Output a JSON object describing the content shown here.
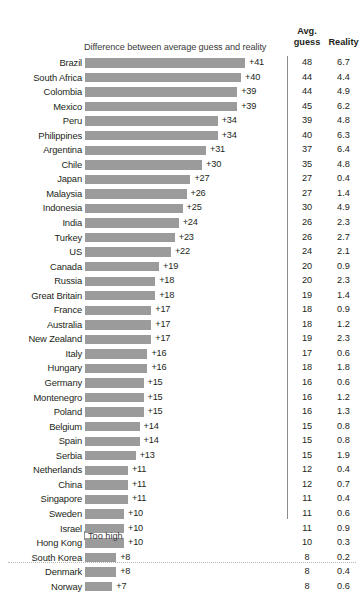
{
  "header": {
    "subtitle": "Difference between average guess and reality",
    "avg_line1": "Avg.",
    "avg_line2": "guess",
    "reality": "Reality"
  },
  "footer": {
    "too_high_label": "Too high"
  },
  "colors": {
    "bar": "#9b9b9b",
    "text": "#231f20",
    "divider": "#8c8c8c",
    "background": "#ffffff"
  },
  "chart_data": {
    "type": "bar",
    "title": "",
    "subtitle": "Difference between average guess and reality",
    "xlabel": "",
    "ylabel": "",
    "orientation": "horizontal",
    "grid": false,
    "legend": "none",
    "xlim": [
      0,
      41
    ],
    "annotations": [
      "Too high"
    ],
    "columns": [
      "Country",
      "Difference between average guess and reality",
      "Avg. guess",
      "Reality"
    ],
    "categories": [
      "Brazil",
      "South Africa",
      "Colombia",
      "Mexico",
      "Peru",
      "Philippines",
      "Argentina",
      "Chile",
      "Japan",
      "Malaysia",
      "Indonesia",
      "India",
      "Turkey",
      "US",
      "Canada",
      "Russia",
      "Great Britain",
      "France",
      "Australia",
      "New Zealand",
      "Italy",
      "Hungary",
      "Germany",
      "Montenegro",
      "Poland",
      "Belgium",
      "Spain",
      "Serbia",
      "Netherlands",
      "China",
      "Singapore",
      "Sweden",
      "Israel",
      "Hong Kong",
      "South Korea",
      "Denmark",
      "Norway"
    ],
    "values": [
      41,
      40,
      39,
      39,
      34,
      34,
      31,
      30,
      27,
      26,
      25,
      24,
      23,
      22,
      19,
      18,
      18,
      17,
      17,
      17,
      16,
      16,
      15,
      15,
      15,
      14,
      14,
      13,
      11,
      11,
      11,
      10,
      10,
      10,
      8,
      8,
      7
    ],
    "value_labels": [
      "+41",
      "+40",
      "+39",
      "+39",
      "+34",
      "+34",
      "+31",
      "+30",
      "+27",
      "+26",
      "+25",
      "+24",
      "+23",
      "+22",
      "+19",
      "+18",
      "+18",
      "+17",
      "+17",
      "+17",
      "+16",
      "+16",
      "+15",
      "+15",
      "+15",
      "+14",
      "+14",
      "+13",
      "+11",
      "+11",
      "+11",
      "+10",
      "+10",
      "+10",
      "+8",
      "+8",
      "+7"
    ],
    "series": [
      {
        "name": "Avg. guess",
        "values": [
          48,
          44,
          44,
          45,
          39,
          40,
          37,
          35,
          27,
          27,
          30,
          26,
          26,
          24,
          20,
          20,
          19,
          18,
          18,
          19,
          17,
          18,
          16,
          16,
          16,
          15,
          15,
          15,
          12,
          12,
          11,
          11,
          11,
          10,
          8,
          8,
          8
        ],
        "display": [
          "48",
          "44",
          "44",
          "45",
          "39",
          "40",
          "37",
          "35",
          "27",
          "27",
          "30",
          "26",
          "26",
          "24",
          "20",
          "20",
          "19",
          "18",
          "18",
          "19",
          "17",
          "18",
          "16",
          "16",
          "16",
          "15",
          "15",
          "15",
          "12",
          "12",
          "11",
          "11",
          "11",
          "10",
          "8",
          "8",
          "8"
        ]
      },
      {
        "name": "Reality",
        "values": [
          6.7,
          4.4,
          4.9,
          6.2,
          4.8,
          6.3,
          6.4,
          4.8,
          0.4,
          1.4,
          4.9,
          2.3,
          2.7,
          2.1,
          0.9,
          2.3,
          1.4,
          0.9,
          1.2,
          2.3,
          0.6,
          1.8,
          0.6,
          1.2,
          1.3,
          0.8,
          0.8,
          1.9,
          0.4,
          0.7,
          0.4,
          0.6,
          0.9,
          0.3,
          0.2,
          0.4,
          0.6
        ],
        "display": [
          "6.7",
          "4.4",
          "4.9",
          "6.2",
          "4.8",
          "6.3",
          "6.4",
          "4.8",
          "0.4",
          "1.4",
          "4.9",
          "2.3",
          "2.7",
          "2.1",
          "0.9",
          "2.3",
          "1.4",
          "0.9",
          "1.2",
          "2.3",
          "0.6",
          "1.8",
          "0.6",
          "1.2",
          "1.3",
          "0.8",
          "0.8",
          "1.9",
          "0.4",
          "0.7",
          "0.4",
          "0.6",
          "0.9",
          "0.3",
          "0.2",
          "0.4",
          "0.6"
        ]
      }
    ]
  }
}
